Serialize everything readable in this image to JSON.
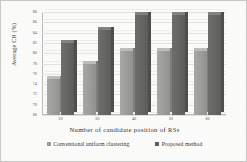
{
  "chart_data": {
    "type": "bar",
    "title": "",
    "xlabel": "Number of candidate position of RSs",
    "ylabel": "Average CR (%)",
    "categories": [
      "20",
      "30",
      "40",
      "50",
      "60"
    ],
    "series": [
      {
        "name": "Conventional uniform clustering",
        "color": "#9c9c98",
        "values": [
          75.0,
          78.0,
          80.5,
          80.5,
          80.5
        ]
      },
      {
        "name": "Proposed method",
        "color": "#5f5f5d",
        "values": [
          82.0,
          84.5,
          87.5,
          87.5,
          87.5
        ]
      }
    ],
    "ylim": [
      68,
      88
    ],
    "ytick_step": 2,
    "yticks": [
      "88",
      "86",
      "84",
      "82",
      "80",
      "78",
      "76",
      "74",
      "72",
      "70",
      "68"
    ],
    "grid": true,
    "legend_position": "bottom",
    "style": "3d-column"
  }
}
